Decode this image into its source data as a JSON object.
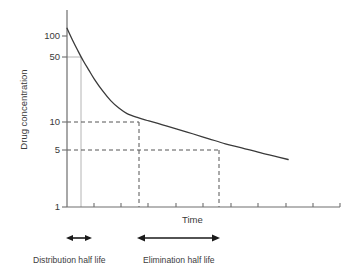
{
  "chart_data": {
    "type": "line",
    "title": "",
    "xlabel": "Time",
    "ylabel": "Drug concentration",
    "yscale": "log",
    "ylim": [
      1,
      160
    ],
    "xlim": [
      0,
      10
    ],
    "grid": false,
    "legend": null,
    "y_ticks": [
      {
        "value": 100,
        "label": "100"
      },
      {
        "value": 50,
        "label": "50"
      },
      {
        "value": 10,
        "label": "10"
      },
      {
        "value": 5,
        "label": "5"
      },
      {
        "value": 1,
        "label": "1"
      }
    ],
    "x_ticks": [
      0,
      1,
      2,
      3,
      4,
      5,
      6,
      7,
      8,
      9,
      10
    ],
    "x_tick_labels": [
      "",
      "",
      "",
      "",
      "",
      "",
      "",
      "",
      "",
      "",
      ""
    ],
    "series": [
      {
        "name": "Plasma drug concentration",
        "description": "Biexponential decay: rapid distribution phase followed by slower elimination phase",
        "x": [
          0.0,
          0.2,
          0.4,
          0.6,
          0.8,
          1.0,
          1.3,
          1.6,
          1.9,
          2.2,
          2.6,
          3.0,
          3.5,
          4.0,
          4.6,
          5.2,
          5.8,
          6.4,
          7.0,
          7.6,
          8.1
        ],
        "y": [
          100,
          74,
          56,
          43,
          34,
          27,
          20,
          15.5,
          12.8,
          11.1,
          10.0,
          9.2,
          8.3,
          7.5,
          6.6,
          5.8,
          5.1,
          4.6,
          4.1,
          3.7,
          3.4
        ]
      }
    ],
    "annotations": [
      {
        "name": "distribution-guide-vertical",
        "style": "solid-light",
        "x": 0.5,
        "from_y": 50,
        "to_y": 1
      },
      {
        "name": "guide-50",
        "style": "solid-light",
        "y": 50,
        "from_x": 0,
        "to_x": 0.5
      },
      {
        "name": "guide-10-horizontal",
        "style": "dashed",
        "y": 10,
        "from_x": 0,
        "to_x": 2.6
      },
      {
        "name": "guide-10-vertical",
        "style": "dashed",
        "x": 2.6,
        "from_y": 10,
        "to_y": 1
      },
      {
        "name": "guide-5-horizontal",
        "style": "dashed",
        "y": 5,
        "from_x": 0,
        "to_x": 5.85
      },
      {
        "name": "guide-5-vertical",
        "style": "dashed",
        "x": 5.85,
        "from_y": 5,
        "to_y": 1
      }
    ],
    "markers": [
      {
        "name": "distribution-half-life-span",
        "from_x": 0.0,
        "to_x": 0.75,
        "label": "Distribution half life"
      },
      {
        "name": "elimination-half-life-span",
        "from_x": 2.6,
        "to_x": 5.85,
        "label": "Elimination half life"
      }
    ]
  },
  "labels": {
    "y_axis_title": "Drug concentration",
    "x_axis_title": "Time",
    "distribution_half_life": "Distribution half life",
    "elimination_half_life": "Elimination half life",
    "tick_100": "100",
    "tick_50": "50",
    "tick_10": "10",
    "tick_5": "5",
    "tick_1": "1"
  },
  "colors": {
    "curve": "#3a3a3a",
    "axis": "#6e6e6e",
    "dashed_guide": "#555555",
    "light_guide": "#b4b4b4",
    "arrow": "#1a1a1a",
    "text": "#3a3a3a",
    "background": "#ffffff"
  }
}
